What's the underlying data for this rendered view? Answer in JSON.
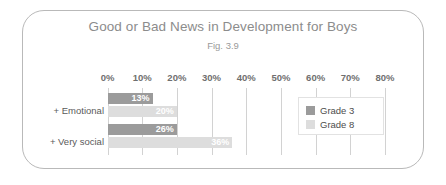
{
  "chart_data": {
    "type": "bar",
    "orientation": "horizontal",
    "title": "Good or Bad News in Development for Boys",
    "subtitle": "Fig. 3.9",
    "xlabel": "",
    "ylabel": "",
    "categories": [
      "+ Emotional",
      "+ Very social"
    ],
    "series": [
      {
        "name": "Grade 3",
        "values": [
          13,
          20
        ],
        "color": "#9b9b9b"
      },
      {
        "name": "Grade 8",
        "values": [
          20,
          36
        ],
        "color": "#dddddd"
      }
    ],
    "bar_labels": [
      [
        "13%",
        "20%"
      ],
      [
        "26%",
        "36%"
      ]
    ],
    "bars": [
      {
        "category": "+ Emotional",
        "series": "Grade 3",
        "value": 13,
        "label": "13%"
      },
      {
        "category": "+ Emotional",
        "series": "Grade 8",
        "value": 20,
        "label": "20%"
      },
      {
        "category": "+ Very social",
        "series": "Grade 3",
        "value": 26,
        "label": "26%"
      },
      {
        "category": "+ Very social",
        "series": "Grade 8",
        "value": 36,
        "label": "36%"
      }
    ],
    "xlim": [
      0,
      80
    ],
    "xticks": [
      0,
      10,
      20,
      30,
      40,
      50,
      60,
      70,
      80
    ],
    "xtick_labels": [
      "0%",
      "10%",
      "20%",
      "30%",
      "40%",
      "50%",
      "60%",
      "70%",
      "80%"
    ],
    "grid": true,
    "legend_position": "right-inside",
    "legend": [
      "Grade 3",
      "Grade 8"
    ]
  },
  "legend": {
    "items": [
      {
        "label": "Grade 3",
        "color": "#9b9b9b"
      },
      {
        "label": "Grade 8",
        "color": "#dddddd"
      }
    ]
  },
  "colors": {
    "grade3": "#9b9b9b",
    "grade8": "#dddddd",
    "gridline": "#d2d2d2",
    "frame_border": "#b9b9b9",
    "title_text": "#8c8c8c",
    "tick_text": "#6f6f6f",
    "category_text": "#5a5a5a",
    "bar_value_text": "#ffffff"
  }
}
